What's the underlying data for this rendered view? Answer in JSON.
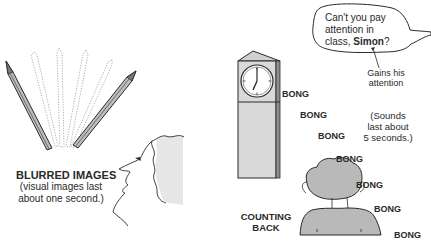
{
  "left_panel": {
    "title": "BLURRED IMAGES",
    "caption_line1": "(visual images last",
    "caption_line2": "about one second.)",
    "icons": [
      "pencil-icon",
      "blurred-pencil-ghost-icon",
      "face-profile-icon"
    ]
  },
  "right_panel": {
    "speech_bubble": {
      "line1": "Can't you pay",
      "line2": "attention in",
      "line3_prefix": "class, ",
      "line3_name": "Simon",
      "line3_suffix": "?"
    },
    "annotation_line1": "Gains his",
    "annotation_line2": "attention",
    "sound_note_line1": "(Sounds",
    "sound_note_line2": "last about",
    "sound_note_line3": "5 seconds.)",
    "counting_back_line1": "COUNTING",
    "counting_back_line2": "BACK",
    "bongs": [
      "BONG",
      "BONG",
      "BONG",
      "BONG",
      "BONG",
      "BONG",
      "BONG"
    ],
    "icons": [
      "clock-tower-icon",
      "boy-back-of-head-icon",
      "speech-bubble-icon"
    ]
  },
  "colors": {
    "ink": "#2a2a2a",
    "shade": "#d4d4d4",
    "light_shade": "#e4e4e4"
  }
}
